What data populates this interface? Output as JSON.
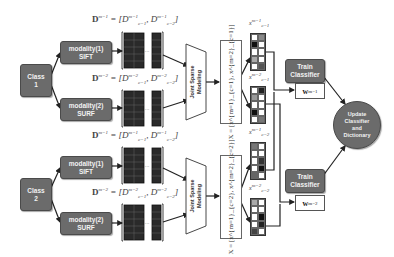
{
  "diagram": {
    "type": "pipeline",
    "classes": [
      {
        "label_line1": "Class",
        "label_line2": "1"
      },
      {
        "label_line1": "Class",
        "label_line2": "2"
      }
    ],
    "modalities": [
      {
        "label_line1": "modality(1)",
        "label_line2": "SIFT"
      },
      {
        "label_line1": "modality(2)",
        "label_line2": "SURF"
      },
      {
        "label_line1": "modality(1)",
        "label_line2": "SIFT"
      },
      {
        "label_line1": "modality(2)",
        "label_line2": "SURF"
      }
    ],
    "dictionary_labels": [
      {
        "main": "D",
        "sup": "m=1",
        "eq": " = [",
        "d1": "D",
        "d1sup": "m=1",
        "d1sub": "c=1",
        "d2": "D",
        "d2sup": "m=1",
        "d2sub": "c=2",
        "close": "]"
      },
      {
        "main": "D",
        "sup": "m=2",
        "eq": " = [",
        "d1": "D",
        "d1sup": "m=2",
        "d1sub": "c=1",
        "d2": "D",
        "d2sup": "m=2",
        "d2sub": "c=2",
        "close": "]"
      },
      {
        "main": "D",
        "sup": "m=1",
        "eq": " = [",
        "d1": "D",
        "d1sup": "m=1",
        "d1sub": "c=1",
        "d2": "D",
        "d2sup": "m=1",
        "d2sub": "c=2",
        "close": "]"
      },
      {
        "main": "D",
        "sup": "m=2",
        "eq": " = [",
        "d1": "D",
        "d1sup": "m=2",
        "d1sub": "c=1",
        "d2": "D",
        "d2sup": "m=2",
        "d2sub": "c=2",
        "close": "]"
      }
    ],
    "joint_sparse_modeling": {
      "line1": "Joint Sparse",
      "line2": "Modeling"
    },
    "x_matrices": [
      {
        "text": "X = [x^{m=1}_{c=1}, x^{m=2}_{c=1}]"
      },
      {
        "text": "X = [x^{m=1}_{c=2}, x^{m=2}_{c=2}]"
      }
    ],
    "sparse_vectors": [
      {
        "label": "x",
        "sup": "m=1",
        "sub": "c=1",
        "cells": [
          "w",
          "#888",
          "#111",
          "w",
          "w",
          "w",
          "#aaa",
          "w",
          "w",
          "#555"
        ]
      },
      {
        "label": "x",
        "sup": "m=2",
        "sub": "c=1",
        "cells": [
          "w",
          "#222",
          "#999",
          "w",
          "w",
          "w",
          "#111",
          "w",
          "w",
          "#777"
        ]
      },
      {
        "label": "x",
        "sup": "m=1",
        "sub": "c=2",
        "cells": [
          "#777",
          "w",
          "w",
          "w",
          "w",
          "#333",
          "w",
          "#111",
          "#666",
          "w"
        ]
      },
      {
        "label": "x",
        "sup": "m=2",
        "sub": "c=2",
        "cells": [
          "#aaa",
          "w",
          "w",
          "w",
          "w",
          "#111",
          "w",
          "#222",
          "#444",
          "w"
        ]
      }
    ],
    "train_classifier": [
      {
        "line1": "Train",
        "line2": "Classifier"
      },
      {
        "line1": "Train",
        "line2": "Classifier"
      }
    ],
    "weights": [
      {
        "label": "w",
        "sup": "m=1"
      },
      {
        "label": "w",
        "sup": "m=2"
      }
    ],
    "update": {
      "line1": "Update",
      "line2": "Classifier",
      "line3": "and",
      "line4": "Dictionary"
    },
    "dots": "· · ·",
    "colors": {
      "box": "#6b6b6b",
      "cell_dark": "#2a2a2a",
      "line": "#222222",
      "text_light": "#f2f2f2"
    }
  }
}
